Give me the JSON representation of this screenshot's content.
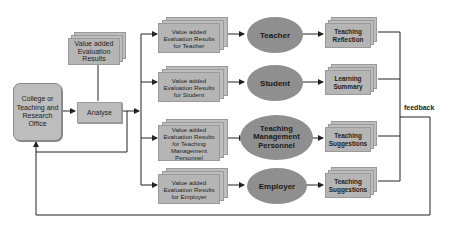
{
  "diagram": {
    "office": {
      "label": "College or Teaching and Research Office"
    },
    "analyse": {
      "label": "Analyse"
    },
    "results": {
      "label": "Value added Evaluation Results"
    },
    "feedback_label": "feedback",
    "rows": [
      {
        "eval_label": "Value added Evaluation Results for Teacher",
        "actor": "Teacher",
        "output": "Teaching Reflection"
      },
      {
        "eval_label": "Value added Evaluation Results for Student",
        "actor": "Student",
        "output": "Learning Summary"
      },
      {
        "eval_label": "Value added Evaluation Results for Teaching Management Personnel",
        "actor": "Teaching Management Personnel",
        "output": "Teaching Suggestions"
      },
      {
        "eval_label": "Value added Evaluation Results for Employer",
        "actor": "Employer",
        "output": "Teaching Suggestions"
      }
    ],
    "colors": {
      "box_fill": "#bdbdbd",
      "ellipse_fill": "#8f8f8f",
      "line": "#222222"
    }
  }
}
